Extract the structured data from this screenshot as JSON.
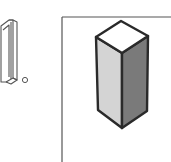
{
  "item": {
    "number_label": "1.",
    "number_glyph": "1",
    "period_glyph": "."
  },
  "figure": {
    "shape": "rectangular prism (isometric)",
    "colors": {
      "outline": "#2a2a2a",
      "top_face": "#ffffff",
      "left_face": "#d4d4d4",
      "right_face": "#7a7a7a",
      "frame_line": "#555555",
      "background": "#ffffff"
    }
  }
}
